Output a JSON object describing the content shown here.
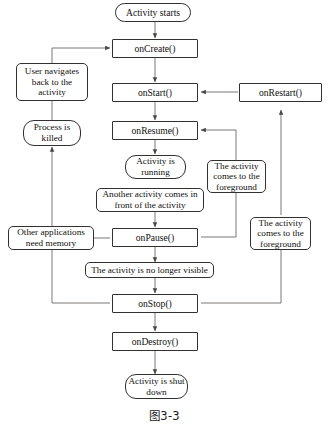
{
  "figure": {
    "caption": "图3-3",
    "line_color": "#33312f",
    "text_color": "#100f0e",
    "background": "#ffffff"
  },
  "nodes": {
    "activity_starts": {
      "label": "Activity starts",
      "shape": "rounded"
    },
    "on_create": {
      "label": "onCreate()",
      "shape": "rect"
    },
    "user_navigates_back": {
      "label": "User navigates back to the activity",
      "shape": "label"
    },
    "on_start": {
      "label": "onStart()",
      "shape": "rect"
    },
    "on_restart": {
      "label": "onRestart()",
      "shape": "rect"
    },
    "process_killed": {
      "label": "Process is killed",
      "shape": "rounded"
    },
    "on_resume": {
      "label": "onResume()",
      "shape": "rect"
    },
    "activity_running": {
      "label": "Activity is running",
      "shape": "rounded"
    },
    "foreground_top": {
      "label": "The activity comes to the foreground",
      "shape": "label"
    },
    "another_activity": {
      "label": "Another activity comes in front of the activity",
      "shape": "label"
    },
    "other_apps_memory": {
      "label": "Other applications need memory",
      "shape": "label"
    },
    "on_pause": {
      "label": "onPause()",
      "shape": "rect"
    },
    "foreground_bottom": {
      "label": "The activity comes to the foreground",
      "shape": "label"
    },
    "no_longer_visible": {
      "label": "The activity is no longer visible",
      "shape": "label"
    },
    "on_stop": {
      "label": "onStop()",
      "shape": "rect"
    },
    "on_destroy": {
      "label": "onDestroy()",
      "shape": "rect"
    },
    "activity_shut_down": {
      "label": "Activity is shut down",
      "shape": "rounded"
    }
  },
  "edges": [
    {
      "from": "activity_starts",
      "to": "on_create"
    },
    {
      "from": "on_create",
      "to": "on_start"
    },
    {
      "from": "on_start",
      "to": "on_resume"
    },
    {
      "from": "on_resume",
      "to": "activity_running"
    },
    {
      "from": "another_activity",
      "to": "on_pause"
    },
    {
      "from": "on_pause",
      "to": "on_stop"
    },
    {
      "from": "on_stop",
      "to": "on_destroy"
    },
    {
      "from": "on_destroy",
      "to": "activity_shut_down"
    },
    {
      "from": "on_restart",
      "to": "on_start"
    },
    {
      "from": "on_stop",
      "to": "on_restart"
    },
    {
      "from": "on_pause",
      "to": "on_resume"
    },
    {
      "from": "user_navigates_back",
      "to": "on_create"
    },
    {
      "from": "on_stop",
      "to": "process_killed"
    }
  ]
}
